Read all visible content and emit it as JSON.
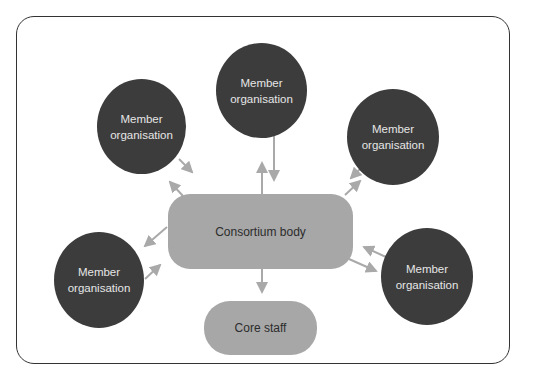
{
  "diagram": {
    "type": "hub-and-spoke organisational diagram",
    "colors": {
      "member_fill": "#3c3c3c",
      "member_text": "#e6e6e6",
      "box_fill": "#a7a7a7",
      "box_text": "#2c2c2c",
      "arrow": "#a9a9a9",
      "frame": "#333333"
    },
    "nodes": {
      "member_top": {
        "label": "Member\norganisation"
      },
      "member_top_left": {
        "label": "Member\norganisation"
      },
      "member_top_right": {
        "label": "Member\norganisation"
      },
      "member_bottom_left": {
        "label": "Member\norganisation"
      },
      "member_bottom_right": {
        "label": "Member\norganisation"
      },
      "consortium_body": {
        "label": "Consortium body"
      },
      "core_staff": {
        "label": "Core staff"
      }
    },
    "edges": [
      {
        "from": "member_top",
        "to": "consortium_body",
        "bidirectional": true
      },
      {
        "from": "member_top_left",
        "to": "consortium_body",
        "bidirectional": true
      },
      {
        "from": "member_top_right",
        "to": "consortium_body",
        "bidirectional": true
      },
      {
        "from": "member_bottom_left",
        "to": "consortium_body",
        "bidirectional": true
      },
      {
        "from": "member_bottom_right",
        "to": "consortium_body",
        "bidirectional": true
      },
      {
        "from": "consortium_body",
        "to": "core_staff",
        "bidirectional": false
      }
    ]
  }
}
